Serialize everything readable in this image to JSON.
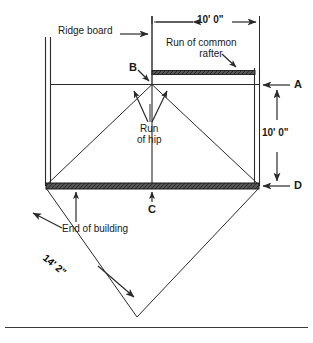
{
  "diagram": {
    "labels": {
      "ridge_board": "Ridge board",
      "run_of_common_rafter_line1": "Run of common",
      "run_of_common_rafter_line2": "rafter",
      "run_of_hip_line1": "Run",
      "run_of_hip_line2": "of hip",
      "end_of_building": "End of building"
    },
    "dimensions": {
      "top_run": "10' 0\"",
      "right_height": "10' 0\"",
      "diagonal_hip": "14' 2\""
    },
    "points": {
      "a": "A",
      "b": "B",
      "c": "C",
      "d": "D"
    },
    "colors": {
      "line": "#2a2a2a",
      "heavy_fill": "#4a4a4a",
      "background": "#ffffff"
    }
  }
}
